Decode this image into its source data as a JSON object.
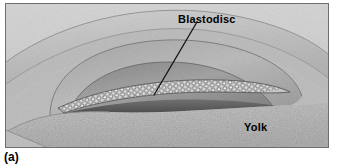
{
  "figure": {
    "caption": "(a)",
    "labels": {
      "blastodisc": "Blastodisc",
      "yolk": "Yolk"
    },
    "colors": {
      "frame_border": "#6e6e6e",
      "background_upper": "#cfcfcf",
      "shell_band": "#c4c4c4",
      "albumen": "#bdbdbd",
      "cavity_shadow": "#8f8f8f",
      "cavity_dark": "#4a4a4a",
      "yolk_fill": "#bcbcbc",
      "blastodisc_cells": "#e8e8e8",
      "leader_line": "#111111",
      "label_text": "#000000"
    },
    "leader_lines": [
      {
        "from_label": "Blastodisc",
        "x1": 196,
        "y1": 24,
        "x2": 152,
        "y2": 92
      }
    ]
  }
}
